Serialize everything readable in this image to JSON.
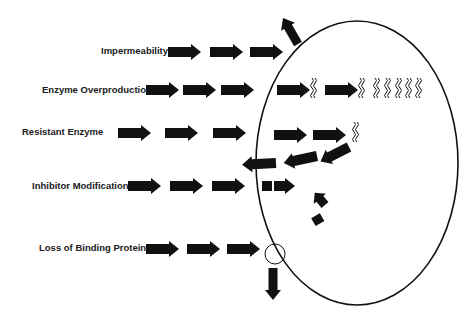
{
  "diagram": {
    "type": "antibiotic-resistance-mechanisms",
    "cell": {
      "shape": "ellipse",
      "stroke": "#111111"
    },
    "mechanisms": [
      {
        "id": "impermeability",
        "label": "Impermeability"
      },
      {
        "id": "enzyme-overproduction",
        "label": "Enzyme Overproduction"
      },
      {
        "id": "resistant-enzyme",
        "label": "Resistant Enzyme"
      },
      {
        "id": "inhibitor-modification",
        "label": "Inhibitor Modification"
      },
      {
        "id": "loss-of-binding-protein",
        "label": "Loss of Binding Protein"
      }
    ],
    "colors": {
      "arrow": "#111111",
      "text": "#1a1a1a",
      "background": "#ffffff"
    }
  }
}
